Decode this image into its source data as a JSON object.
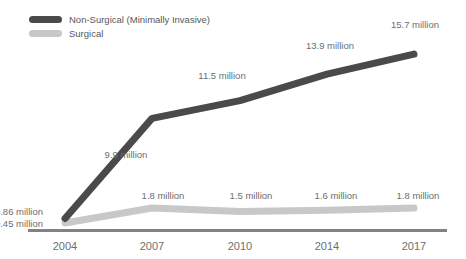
{
  "chart_data": {
    "type": "line",
    "title": "",
    "subtitle": "",
    "xlabel": "",
    "ylabel": "",
    "grid": false,
    "legend_position": "top-left",
    "categories": [
      "2004",
      "2007",
      "2010",
      "2014",
      "2017"
    ],
    "series": [
      {
        "name": "Non-Surgical (Minimally Invasive)",
        "color": "#4a4a4c",
        "values": [
          0.86,
          9.9,
          11.5,
          13.9,
          15.7
        ],
        "labels": [
          "0.86 million",
          "9.9 million",
          "11.5 million",
          "13.9 million",
          "15.7 million"
        ]
      },
      {
        "name": "Surgical",
        "color": "#c7c8ca",
        "values": [
          0.45,
          1.8,
          1.5,
          1.6,
          1.8
        ],
        "labels": [
          "0.45 million",
          "1.8 million",
          "1.5 million",
          "1.6 million",
          "1.8 million"
        ]
      }
    ],
    "ylim": [
      0,
      16.8
    ],
    "axis_color": "#808285"
  },
  "legend": {
    "items": [
      {
        "label": "Non-Surgical (Minimally Invasive)",
        "color": "#4a4a4c"
      },
      {
        "label": "Surgical",
        "color": "#c7c8ca"
      }
    ]
  },
  "xaxis": {
    "ticks": [
      {
        "label": "2004"
      },
      {
        "label": "2007"
      },
      {
        "label": "2010"
      },
      {
        "label": "2014"
      },
      {
        "label": "2017"
      }
    ]
  },
  "annotations": {
    "nonsurgical": [
      {
        "text": "0.86 million",
        "x": 43,
        "y": 215,
        "anchor": "end"
      },
      {
        "text": "9.9 million",
        "x": 126,
        "y": 158,
        "anchor": "middle"
      },
      {
        "text": "11.5 million",
        "x": 222,
        "y": 79,
        "anchor": "middle"
      },
      {
        "text": "13.9 million",
        "x": 330,
        "y": 49,
        "anchor": "middle"
      },
      {
        "text": "15.7 million",
        "x": 415,
        "y": 28,
        "anchor": "middle"
      }
    ],
    "surgical": [
      {
        "text": "0.45 million",
        "x": 43,
        "y": 227,
        "anchor": "end"
      },
      {
        "text": "1.8 million",
        "x": 163,
        "y": 199,
        "anchor": "middle"
      },
      {
        "text": "1.5 million",
        "x": 251,
        "y": 199,
        "anchor": "middle"
      },
      {
        "text": "1.6 million",
        "x": 336,
        "y": 199,
        "anchor": "middle"
      },
      {
        "text": "1.8 million",
        "x": 418,
        "y": 199,
        "anchor": "middle"
      }
    ]
  }
}
